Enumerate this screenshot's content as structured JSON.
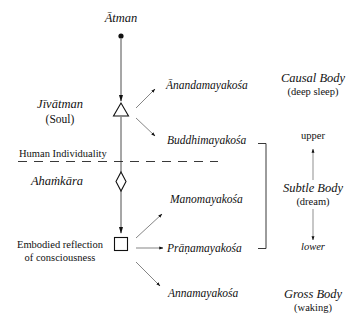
{
  "diagram": {
    "top": {
      "atman": "Ātman"
    },
    "left": {
      "jivatman": "Jīvātman",
      "soul": "(Soul)",
      "human_individuality": "Human Individuality",
      "ahamkara": "Ahaṁkāra",
      "embodied_line1": "Embodied reflection",
      "embodied_line2": "of consciousness"
    },
    "koshas": [
      {
        "label": "Ānandamayakośa"
      },
      {
        "label": "Buddhimayakośa"
      },
      {
        "label": "Manomayakośa"
      },
      {
        "label": "Prāṇamayakośa"
      },
      {
        "label": "Annamayakośa"
      }
    ],
    "bodies": {
      "causal": {
        "name": "Causal Body",
        "state": "(deep sleep)"
      },
      "subtle": {
        "name": "Subtle Body",
        "state": "(dream)",
        "upper": "upper",
        "lower": "lower"
      },
      "gross": {
        "name": "Gross Body",
        "state": "(waking)"
      }
    },
    "symbols": {
      "atman": "dot",
      "jivatman": "triangle",
      "ahamkara": "diamond",
      "embodied": "square"
    },
    "colors": {
      "ink": "#111111",
      "background": "#ffffff"
    }
  }
}
